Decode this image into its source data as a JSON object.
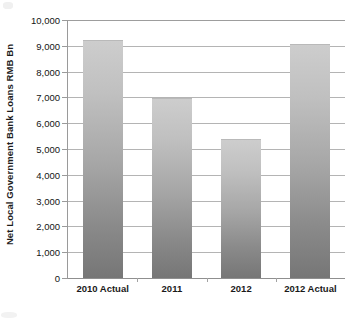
{
  "chart_data": {
    "type": "bar",
    "title": "",
    "subtitle": "",
    "xlabel": "",
    "ylabel": "Net Local Government Bank Loans RMB Bn",
    "categories": [
      "2010 Actual",
      "2011",
      "2012",
      "2012 Actual"
    ],
    "values": [
      9220,
      6980,
      5400,
      9080
    ],
    "ylim": [
      0,
      10000
    ],
    "ytick_labels": [
      "10,000",
      "9,000",
      "8,000",
      "7,000",
      "6,000",
      "5,000",
      "4,000",
      "3,000",
      "2,000",
      "1,000",
      "0"
    ],
    "ytick_values": [
      10000,
      9000,
      8000,
      7000,
      6000,
      5000,
      4000,
      3000,
      2000,
      1000,
      0
    ],
    "grid": true,
    "legend": null,
    "legend_position": "none",
    "series": [
      {
        "name": "Net Local Government Bank Loans RMB Bn",
        "values": [
          9220,
          6980,
          5400,
          9080
        ]
      }
    ],
    "bar_fill_top_color": "#cdcdcd",
    "bar_fill_bottom_color": "#767676",
    "gridline_color": "#b4b4b4",
    "axis_color": "#9a9a9a",
    "text_color": "#141414"
  }
}
